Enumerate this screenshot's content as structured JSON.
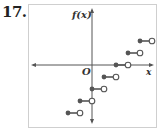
{
  "problem_number": "17.",
  "chart_data": {
    "type": "step",
    "title": "",
    "xlabel": "x",
    "ylabel": "f(x)",
    "origin_label": "O",
    "function": "f(x) = [[x]] - 2",
    "grid": false,
    "segments": [
      {
        "x_start": -2,
        "x_end": -1,
        "y": -4,
        "start": "closed",
        "end": "open"
      },
      {
        "x_start": -1,
        "x_end": 0,
        "y": -3,
        "start": "closed",
        "end": "open"
      },
      {
        "x_start": 0,
        "x_end": 1,
        "y": -2,
        "start": "closed",
        "end": "open"
      },
      {
        "x_start": 1,
        "x_end": 2,
        "y": -1,
        "start": "closed",
        "end": "open"
      },
      {
        "x_start": 2,
        "x_end": 3,
        "y": 0,
        "start": "closed",
        "end": "open"
      },
      {
        "x_start": 3,
        "x_end": 4,
        "y": 1,
        "start": "closed",
        "end": "open"
      },
      {
        "x_start": 4,
        "x_end": 5,
        "y": 2,
        "start": "closed",
        "end": "open"
      }
    ],
    "colors": {
      "line": "#555555",
      "closed_dot": "#555555",
      "open_dot_fill": "#ffffff"
    }
  }
}
